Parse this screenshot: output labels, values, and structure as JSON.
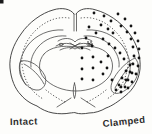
{
  "figure": {
    "background": "#fdfdfb",
    "line_color": "#3f3f3f",
    "label_color": "#2d2d2d",
    "labels": {
      "left": "Intact",
      "right": "Clamped"
    },
    "corner_mark_color": "#1a1a1a"
  },
  "lesion_dots": {
    "description": "damage-marker-dots-on-clamped-hemisphere",
    "color": "#141414",
    "radius": 1.4,
    "small_radius": 0.8,
    "cortex_outer_arc": [
      [
        118,
        14
      ],
      [
        125,
        19
      ],
      [
        131,
        26
      ],
      [
        135,
        33
      ],
      [
        138,
        41
      ],
      [
        139,
        49
      ],
      [
        139,
        58
      ],
      [
        138,
        66
      ],
      [
        136,
        74
      ],
      [
        132,
        82
      ],
      [
        128,
        88
      ]
    ],
    "cortex_inner_arc": [
      [
        121,
        26
      ],
      [
        127,
        32
      ],
      [
        131,
        39
      ],
      [
        133,
        47
      ],
      [
        134,
        56
      ],
      [
        133,
        64
      ],
      [
        130,
        72
      ],
      [
        126,
        80
      ],
      [
        121,
        87
      ]
    ],
    "dorsal_cortex": [
      [
        94,
        13
      ],
      [
        104,
        16
      ],
      [
        111,
        21
      ],
      [
        101,
        25
      ],
      [
        89,
        27
      ],
      [
        108,
        29
      ],
      [
        96,
        33
      ],
      [
        113,
        33
      ],
      [
        86,
        38
      ],
      [
        103,
        39
      ]
    ],
    "striatum": [
      [
        109,
        44
      ],
      [
        115,
        48
      ],
      [
        120,
        53
      ],
      [
        124,
        59
      ]
    ],
    "thalamus": [
      [
        82,
        48
      ],
      [
        82,
        58
      ],
      [
        82,
        69
      ],
      [
        82,
        79
      ],
      [
        92,
        46
      ],
      [
        93,
        57
      ],
      [
        93,
        68
      ],
      [
        93,
        80
      ],
      [
        101,
        62
      ],
      [
        103,
        74
      ],
      [
        108,
        56
      ],
      [
        107,
        68
      ],
      [
        112,
        80
      ]
    ],
    "lateral_lens": [
      [
        130,
        65
      ],
      [
        126,
        71
      ],
      [
        132,
        73
      ],
      [
        122,
        78
      ],
      [
        128,
        80
      ],
      [
        119,
        85
      ],
      [
        125,
        87
      ],
      [
        116,
        90
      ],
      [
        121,
        92
      ]
    ],
    "hippocampus_cluster": [
      [
        88,
        42
      ],
      [
        91,
        42
      ],
      [
        89,
        44
      ],
      [
        92,
        44
      ]
    ]
  }
}
